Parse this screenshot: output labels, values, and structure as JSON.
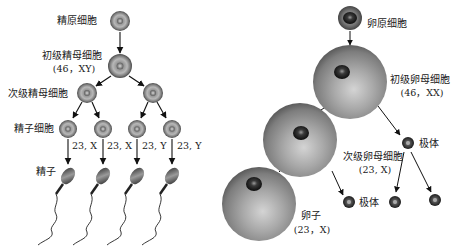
{
  "spermatogenesis": {
    "spermatogonium": {
      "label": "精原细胞"
    },
    "primary_spermatocyte": {
      "label": "初级精母细胞",
      "karyotype": "(46，XY)"
    },
    "secondary_spermatocyte": {
      "label": "次级精母细胞"
    },
    "spermatid": {
      "label": "精子细胞"
    },
    "chromosome_labels": [
      "23, X",
      "23, X",
      "23, Y",
      "23, Y"
    ],
    "sperm": {
      "label": "精子"
    }
  },
  "oogenesis": {
    "oogonium": {
      "label": "卵原细胞"
    },
    "primary_oocyte": {
      "label": "初级卵母细胞",
      "karyotype": "(46，XX)"
    },
    "secondary_oocyte": {
      "label": "次级卵母细胞",
      "karyotype": "(23, X)"
    },
    "polar_body_1": {
      "label": "极体"
    },
    "polar_body_2": {
      "label": "极体"
    },
    "ovum": {
      "label": "卵子",
      "karyotype": "(23，X)"
    }
  },
  "colors": {
    "cell_outer": "#6e6e6e",
    "cell_inner": "#b0b0b0",
    "nucleus": "#1a1a1a",
    "arrow": "#111111"
  }
}
